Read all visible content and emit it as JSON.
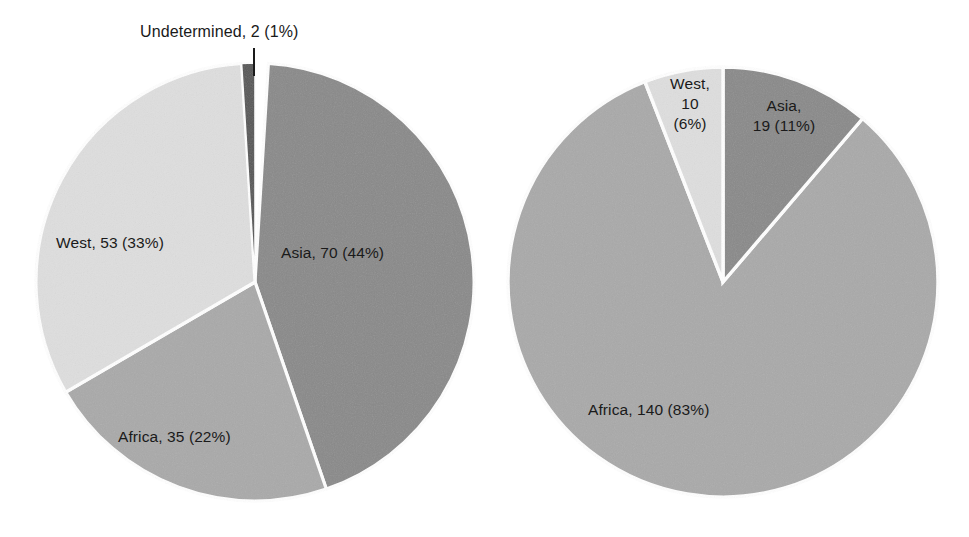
{
  "figure": {
    "background_color": "#ffffff",
    "width": 969,
    "height": 537
  },
  "palette": {
    "asia": "#898989",
    "west": "#dedede",
    "africa": "#a9a9a9",
    "undetermined": "#555555",
    "separator": "#ffffff",
    "text": "#1a1a1a",
    "leader_line": "#1a1a1a"
  },
  "chart_data": [
    {
      "type": "pie",
      "name": "left-pie",
      "title": "",
      "total": 160,
      "center": [
        255,
        282
      ],
      "radius": 219,
      "start_angle_deg": 0,
      "direction": "clockwise",
      "categories": [
        "Asia",
        "Africa",
        "West",
        "Undetermined"
      ],
      "values": [
        70,
        35,
        53,
        2
      ],
      "percents": [
        44,
        22,
        33,
        1
      ],
      "colors": [
        "#898989",
        "#a9a9a9",
        "#dedede",
        "#555555"
      ],
      "slices": [
        {
          "label": "Asia",
          "value": 70,
          "percent": 44,
          "text": "Asia, 70 (44%)",
          "color": "#898989",
          "start_deg": 3.5,
          "sweep_deg": 157.5
        },
        {
          "label": "Africa",
          "value": 35,
          "percent": 22,
          "text": "Africa, 35 (22%)",
          "color": "#a9a9a9",
          "start_deg": 161.0,
          "sweep_deg": 78.8
        },
        {
          "label": "West",
          "value": 53,
          "percent": 33,
          "text": "West, 53 (33%)",
          "color": "#dedede",
          "start_deg": 239.8,
          "sweep_deg": 116.7
        },
        {
          "label": "Undetermined",
          "value": 2,
          "percent": 1,
          "text": "Undetermined, 2 (1%)",
          "color": "#555555",
          "start_deg": 356.5,
          "sweep_deg": 3.5,
          "has_leader_line": true
        }
      ]
    },
    {
      "type": "pie",
      "name": "right-pie",
      "title": "",
      "total": 169,
      "center": [
        723,
        282
      ],
      "radius": 215,
      "start_angle_deg": 0,
      "direction": "clockwise",
      "categories": [
        "Asia",
        "Africa",
        "West"
      ],
      "values": [
        19,
        140,
        10
      ],
      "percents": [
        11,
        83,
        6
      ],
      "colors": [
        "#898989",
        "#a9a9a9",
        "#dedede"
      ],
      "slices": [
        {
          "label": "Asia",
          "value": 19,
          "percent": 11,
          "text": "Asia, 19 (11%)",
          "color": "#898989",
          "start_deg": 0,
          "sweep_deg": 40.5
        },
        {
          "label": "Africa",
          "value": 140,
          "percent": 83,
          "text": "Africa, 140 (83%)",
          "color": "#a9a9a9",
          "start_deg": 40.5,
          "sweep_deg": 298.2
        },
        {
          "label": "West",
          "value": 10,
          "percent": 6,
          "text": "West, 10 (6%)",
          "color": "#dedede",
          "start_deg": 338.7,
          "sweep_deg": 21.3
        }
      ]
    }
  ],
  "labels": {
    "left": {
      "undetermined": "Undetermined, 2 (1%)",
      "west": "West, 53 (33%)",
      "asia": "Asia, 70 (44%)",
      "africa": "Africa, 35 (22%)"
    },
    "right": {
      "west_line1": "West,",
      "west_line2": "10",
      "west_line3": "(6%)",
      "asia_line1": "Asia,",
      "asia_line2": "19 (11%)",
      "africa": "Africa, 140 (83%)"
    }
  }
}
